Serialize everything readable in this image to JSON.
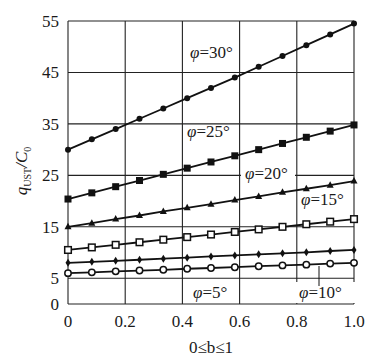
{
  "chart_data": {
    "type": "line",
    "title": "",
    "xlabel": "0≤b≤1",
    "ylabel": "q_UST/C_0",
    "ylabel_main": "q",
    "ylabel_sub": "UST",
    "ylabel_den": "/C",
    "ylabel_den_sub": "0",
    "xlim": [
      0,
      1.0
    ],
    "ylim": [
      0,
      55
    ],
    "grid": true,
    "x_ticks": [
      "0",
      "0.2",
      "0.4",
      "0.6",
      "0.8",
      "1.0"
    ],
    "y_ticks": [
      "0",
      "5",
      "15",
      "25",
      "35",
      "45",
      "55"
    ],
    "y_tick_values": [
      0,
      5,
      15,
      25,
      35,
      45,
      55
    ],
    "x": [
      0,
      0.0833,
      0.1667,
      0.25,
      0.3333,
      0.4167,
      0.5,
      0.5833,
      0.6667,
      0.75,
      0.8333,
      0.9167,
      1.0
    ],
    "series": [
      {
        "name": "φ=30°",
        "label": "φ=30°",
        "marker": "filled-circle",
        "start": 30.0,
        "end": 54.5,
        "values": [
          30.0,
          32.0,
          34.0,
          36.0,
          38.0,
          40.0,
          42.0,
          44.0,
          46.1,
          48.2,
          50.3,
          52.4,
          54.5
        ]
      },
      {
        "name": "φ=25°",
        "label": "φ=25°",
        "marker": "filled-square",
        "start": 20.4,
        "end": 34.8,
        "values": [
          20.4,
          21.6,
          22.8,
          24.0,
          25.2,
          26.4,
          27.6,
          28.8,
          30.0,
          31.2,
          32.4,
          33.6,
          34.8
        ]
      },
      {
        "name": "φ=20°",
        "label": "φ=20°",
        "marker": "filled-triangle",
        "start": 15.0,
        "end": 23.9,
        "values": [
          15.0,
          15.7,
          16.5,
          17.2,
          18.0,
          18.7,
          19.4,
          20.2,
          20.9,
          21.7,
          22.4,
          23.1,
          23.9
        ]
      },
      {
        "name": "φ=15°",
        "label": "φ=15°",
        "marker": "open-square",
        "start": 10.5,
        "end": 16.5,
        "values": [
          10.5,
          11.0,
          11.5,
          12.0,
          12.5,
          13.0,
          13.5,
          14.0,
          14.5,
          15.0,
          15.5,
          16.0,
          16.5
        ]
      },
      {
        "name": "φ=10°",
        "label": "φ=10°",
        "marker": "filled-diamond",
        "start": 8.0,
        "end": 10.5,
        "values": [
          8.0,
          8.2,
          8.4,
          8.6,
          8.8,
          9.0,
          9.25,
          9.45,
          9.65,
          9.85,
          10.05,
          10.3,
          10.5
        ]
      },
      {
        "name": "φ=5°",
        "label": "φ=5°",
        "marker": "open-circle",
        "start": 6.0,
        "end": 8.0,
        "values": [
          6.0,
          6.15,
          6.35,
          6.5,
          6.65,
          6.85,
          7.0,
          7.15,
          7.35,
          7.5,
          7.65,
          7.85,
          8.0
        ]
      }
    ],
    "annotations": [
      "φ=30°",
      "φ=25°",
      "φ=20°",
      "φ=15°",
      "φ=10°",
      "φ=5°"
    ],
    "legend_position": "inline labels"
  }
}
